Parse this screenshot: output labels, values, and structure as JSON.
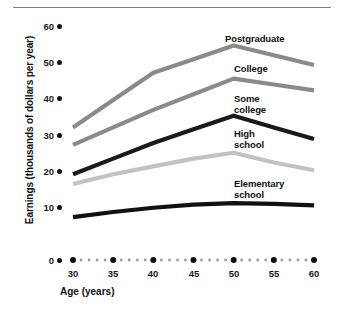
{
  "chart_data": {
    "type": "line",
    "title": "",
    "xlabel": "Age (years)",
    "ylabel": "Earnings (thousands of dollars per year)",
    "x": [
      30,
      35,
      40,
      45,
      50,
      55,
      60
    ],
    "xlim": [
      28.5,
      61.5
    ],
    "ylim": [
      0,
      62
    ],
    "xticks": [
      "30",
      "35",
      "40",
      "45",
      "50",
      "55",
      "60"
    ],
    "yticks": [
      "0",
      "10",
      "20",
      "30",
      "40",
      "50",
      "60"
    ],
    "grid": false,
    "legend_position": "inline-right",
    "series": [
      {
        "name": "Postgraduate",
        "color": "#8a8a8a",
        "values": [
          34,
          41,
          48,
          51.5,
          55,
          52.5,
          50
        ]
      },
      {
        "name": "College",
        "color": "#8a8a8a",
        "values": [
          29.5,
          34,
          38.5,
          42.5,
          46.5,
          45,
          43.5
        ]
      },
      {
        "name": "Some college",
        "color": "#1a1a1a",
        "values": [
          22,
          26,
          30,
          33.5,
          37,
          34,
          31
        ]
      },
      {
        "name": "High school",
        "color": "#c2c2c2",
        "values": [
          19.5,
          22,
          24,
          26,
          27.5,
          25,
          23
        ]
      },
      {
        "name": "Elementary school",
        "color": "#111111",
        "values": [
          11,
          12.3,
          13.4,
          14.2,
          14.6,
          14.4,
          14
        ]
      }
    ],
    "axis_style": {
      "x_axis_dotted": true,
      "tick_dot_color": "#111111",
      "minor_dot_color": "#9a9a9a"
    }
  },
  "labels": {
    "postgraduate": "Postgraduate",
    "college": "College",
    "some_college": "Some\ncollege",
    "high_school": "High\nschool",
    "elementary_school": "Elementary\nschool"
  }
}
